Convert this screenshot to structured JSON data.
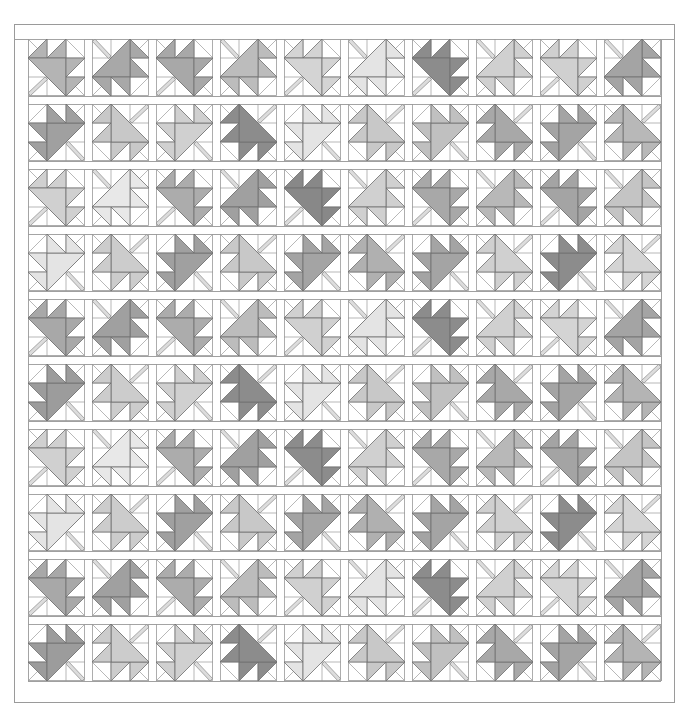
{
  "quilt": {
    "rows": 10,
    "cols": 10,
    "block_size_px": 57,
    "col_pitch_px": 64,
    "row_pitch_px": 65,
    "origin": {
      "x": 28,
      "y": 39
    },
    "outer_frame": {
      "x": 14,
      "y": 24,
      "w": 661,
      "h": 679
    },
    "line_color": "#9a9a9a",
    "stem_color": "#dcdcdc",
    "background": "#ffffff",
    "orientations": {
      "A": {
        "label": "stem bottom-left",
        "rotation": 0
      },
      "B": {
        "label": "stem top-left",
        "rotation": 90
      },
      "D": {
        "label": "stem top-right",
        "rotation": 180
      },
      "C": {
        "label": "stem bottom-right",
        "rotation": 270
      }
    },
    "row_patterns": [
      [
        "A",
        "B",
        "A",
        "B",
        "A",
        "B",
        "A",
        "B",
        "A",
        "B"
      ],
      [
        "C",
        "D",
        "C",
        "D",
        "C",
        "D",
        "C",
        "D",
        "C",
        "D"
      ],
      [
        "A",
        "B",
        "A",
        "B",
        "A",
        "B",
        "A",
        "B",
        "A",
        "B"
      ],
      [
        "C",
        "D",
        "C",
        "D",
        "C",
        "D",
        "C",
        "D",
        "C",
        "D"
      ],
      [
        "A",
        "B",
        "A",
        "B",
        "A",
        "B",
        "A",
        "B",
        "A",
        "B"
      ],
      [
        "C",
        "D",
        "C",
        "D",
        "C",
        "D",
        "C",
        "D",
        "C",
        "D"
      ],
      [
        "A",
        "B",
        "A",
        "B",
        "A",
        "B",
        "A",
        "B",
        "A",
        "B"
      ],
      [
        "C",
        "D",
        "C",
        "D",
        "C",
        "D",
        "C",
        "D",
        "C",
        "D"
      ],
      [
        "A",
        "B",
        "A",
        "B",
        "A",
        "B",
        "A",
        "B",
        "A",
        "B"
      ],
      [
        "C",
        "D",
        "C",
        "D",
        "C",
        "D",
        "C",
        "D",
        "C",
        "D"
      ]
    ],
    "shades": [
      [
        "#b4b4b4",
        "#a8a8a8",
        "#a8a8a8",
        "#bcbcbc",
        "#d4d4d4",
        "#e4e4e4",
        "#8c8c8c",
        "#d0d0d0",
        "#d0d0d0",
        "#a4a4a4"
      ],
      [
        "#a0a0a0",
        "#c8c8c8",
        "#d0d0d0",
        "#8c8c8c",
        "#e4e4e4",
        "#c8c8c8",
        "#c0c0c0",
        "#a8a8a8",
        "#a4a4a4",
        "#b8b8b8"
      ],
      [
        "#d0d0d0",
        "#e8e8e8",
        "#acacac",
        "#a0a0a0",
        "#888888",
        "#d0d0d0",
        "#a8a8a8",
        "#b8b8b8",
        "#a4a4a4",
        "#c4c4c4"
      ],
      [
        "#e4e4e4",
        "#cccccc",
        "#a0a0a0",
        "#c8c8c8",
        "#a4a4a4",
        "#b0b0b0",
        "#a4a4a4",
        "#d0d0d0",
        "#8c8c8c",
        "#d4d4d4"
      ],
      [
        "#a8a8a8",
        "#a0a0a0",
        "#acacac",
        "#bcbcbc",
        "#d0d0d0",
        "#e4e4e4",
        "#8c8c8c",
        "#d0d0d0",
        "#d4d4d4",
        "#a4a4a4"
      ],
      [
        "#9c9c9c",
        "#cccccc",
        "#d0d0d0",
        "#8c8c8c",
        "#e4e4e4",
        "#c8c8c8",
        "#c0c0c0",
        "#a8a8a8",
        "#a4a4a4",
        "#b4b4b4"
      ],
      [
        "#d0d0d0",
        "#e8e8e8",
        "#acacac",
        "#a0a0a0",
        "#8c8c8c",
        "#d0d0d0",
        "#a8a8a8",
        "#b8b8b8",
        "#a4a4a4",
        "#c4c4c4"
      ],
      [
        "#e4e4e4",
        "#cccccc",
        "#a0a0a0",
        "#c8c8c8",
        "#a4a4a4",
        "#b0b0b0",
        "#a4a4a4",
        "#d0d0d0",
        "#8c8c8c",
        "#d4d4d4"
      ],
      [
        "#a8a8a8",
        "#a0a0a0",
        "#acacac",
        "#bcbcbc",
        "#d0d0d0",
        "#e4e4e4",
        "#8c8c8c",
        "#d0d0d0",
        "#d4d4d4",
        "#a4a4a4"
      ],
      [
        "#9c9c9c",
        "#cccccc",
        "#d0d0d0",
        "#8c8c8c",
        "#e4e4e4",
        "#c8c8c8",
        "#c0c0c0",
        "#a8a8a8",
        "#a4a4a4",
        "#b4b4b4"
      ]
    ]
  }
}
